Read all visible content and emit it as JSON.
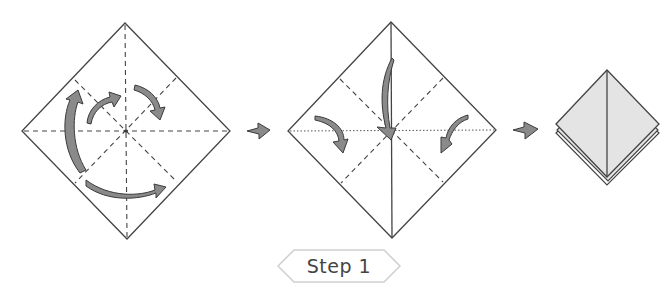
{
  "diagram": {
    "type": "origami-instructions",
    "step_label": "Step 1",
    "colors": {
      "line": "#444444",
      "arrow_fill": "#8a8a8a",
      "arrow_stroke": "#3a3a3a",
      "paper_shaded": "#e4e4e4",
      "label_border": "#cccccc"
    },
    "panels": [
      {
        "name": "square-with-creases",
        "description": "Diamond with dashed valley/mountain creases and rotation arrows"
      },
      {
        "name": "collapse-fold",
        "description": "Diamond folding sides inward toward center"
      },
      {
        "name": "result-square-base",
        "description": "Small shaded folded square base"
      }
    ],
    "transition_arrows": 2
  }
}
